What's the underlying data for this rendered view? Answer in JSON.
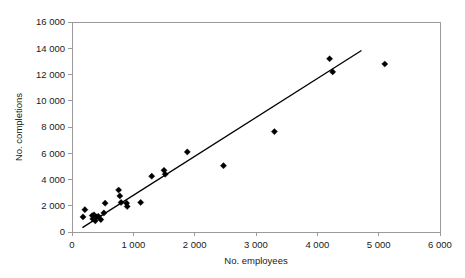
{
  "chart_data": {
    "type": "scatter",
    "title": "",
    "xlabel": "No. employees",
    "ylabel": "No. completions",
    "xlim": [
      0,
      6000
    ],
    "ylim": [
      0,
      16000
    ],
    "xticks": [
      0,
      1000,
      2000,
      3000,
      4000,
      5000,
      6000
    ],
    "yticks": [
      0,
      2000,
      4000,
      6000,
      8000,
      10000,
      12000,
      14000,
      16000
    ],
    "xtick_labels": [
      "0",
      "1 000",
      "2 000",
      "3 000",
      "4 000",
      "5 000",
      "6 000"
    ],
    "ytick_labels": [
      "0",
      "2 000",
      "4 000",
      "6 000",
      "8 000",
      "10 000",
      "12 000",
      "14 000",
      "16 000"
    ],
    "grid": false,
    "legend": false,
    "marker": "diamond",
    "marker_color": "#000000",
    "points": [
      {
        "x": 180,
        "y": 1150
      },
      {
        "x": 210,
        "y": 1700
      },
      {
        "x": 330,
        "y": 1250
      },
      {
        "x": 340,
        "y": 1000
      },
      {
        "x": 360,
        "y": 1300
      },
      {
        "x": 380,
        "y": 850
      },
      {
        "x": 400,
        "y": 1150
      },
      {
        "x": 430,
        "y": 1200
      },
      {
        "x": 470,
        "y": 950
      },
      {
        "x": 520,
        "y": 1450
      },
      {
        "x": 540,
        "y": 2200
      },
      {
        "x": 760,
        "y": 3200
      },
      {
        "x": 780,
        "y": 2750
      },
      {
        "x": 800,
        "y": 2250
      },
      {
        "x": 890,
        "y": 2200
      },
      {
        "x": 900,
        "y": 1950
      },
      {
        "x": 1120,
        "y": 2250
      },
      {
        "x": 1300,
        "y": 4250
      },
      {
        "x": 1500,
        "y": 4700
      },
      {
        "x": 1520,
        "y": 4400
      },
      {
        "x": 1880,
        "y": 6100
      },
      {
        "x": 2470,
        "y": 5050
      },
      {
        "x": 3300,
        "y": 7650
      },
      {
        "x": 4200,
        "y": 13200
      },
      {
        "x": 4250,
        "y": 12200
      },
      {
        "x": 5100,
        "y": 12800
      }
    ],
    "trend_line": {
      "x_start": 170,
      "y_start": 330,
      "x_end": 4720,
      "y_end": 13830
    }
  }
}
